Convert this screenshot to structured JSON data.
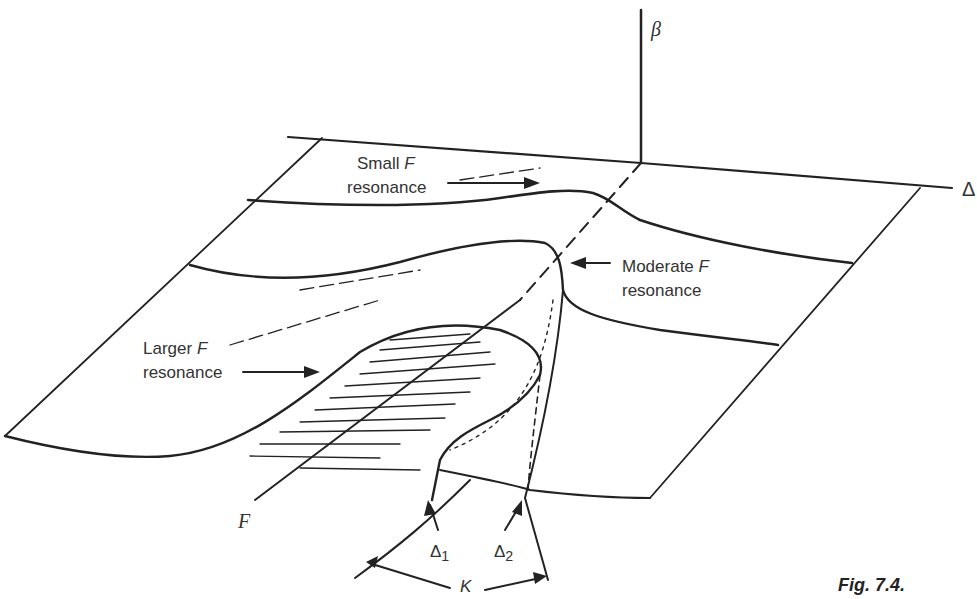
{
  "axes": {
    "vertical": "β",
    "horizontal": "Δ",
    "depth": "F"
  },
  "annotations": {
    "small_f": {
      "line1": "Small ",
      "f": "F",
      "line2": "resonance"
    },
    "moderate_f": {
      "line1": "Moderate ",
      "f": "F",
      "line2": "resonance"
    },
    "larger_f": {
      "line1": "Larger ",
      "f": "F",
      "line2": "resonance"
    },
    "delta1": {
      "base": "Δ",
      "sub": "1"
    },
    "delta2": {
      "base": "Δ",
      "sub": "2"
    },
    "k": "K"
  },
  "caption": "Fig. 7.4.",
  "colors": {
    "ink": "#222222",
    "background": "#ffffff"
  }
}
